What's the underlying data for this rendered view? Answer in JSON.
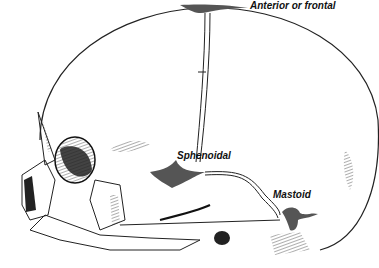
{
  "diagram": {
    "labels": {
      "anterior": "Anterior or frontal",
      "sphenoidal": "Sphenoidal",
      "mastoid": "Mastoid"
    },
    "colors": {
      "fontanelle_fill": "#555555",
      "line": "#222222",
      "background": "#ffffff"
    }
  }
}
